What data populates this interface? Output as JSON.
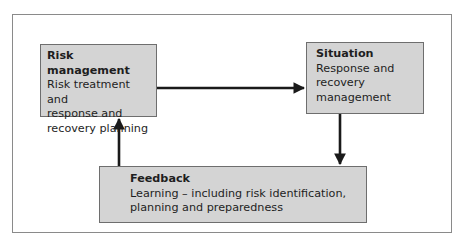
{
  "diagram": {
    "type": "cycle-flow",
    "nodes": [
      {
        "id": "risk_management",
        "title": "Risk management",
        "body": "Risk treatment and response and recovery planning",
        "lines": [
          "Risk treatment and",
          "response and",
          "recovery planning"
        ]
      },
      {
        "id": "situation",
        "title": "Situation",
        "body": "Response and recovery management",
        "lines": [
          "Response and",
          "recovery",
          "management"
        ]
      },
      {
        "id": "feedback",
        "title": "Feedback",
        "body": "Learning – including risk identification, planning and preparedness",
        "lines": [
          "Learning – including risk identification,",
          "planning and preparedness"
        ]
      }
    ],
    "edges": [
      {
        "from": "risk_management",
        "to": "situation"
      },
      {
        "from": "situation",
        "to": "feedback"
      },
      {
        "from": "feedback",
        "to": "risk_management"
      }
    ],
    "colors": {
      "box_fill": "#d4d4d4",
      "box_border": "#6e6e6e",
      "frame_border": "#8a8a8a",
      "arrow": "#1a1a1a"
    }
  }
}
